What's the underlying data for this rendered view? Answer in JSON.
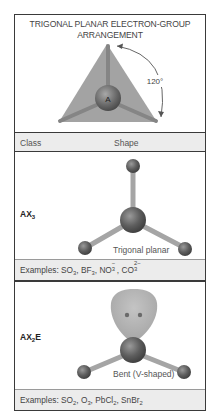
{
  "title": {
    "line1": "TRIGONAL PLANAR ELECTRON-GROUP",
    "line2": "ARRANGEMENT"
  },
  "diagram": {
    "central_atom_label": "A",
    "angle_label": "120°",
    "colors": {
      "triangle_fill": "#a0a0a0",
      "bond": "#8c8c8c",
      "atom": "#5a5a5a",
      "lone_pair_lobe": "#b0b0b0",
      "border": "#3a3a3a",
      "row_bg": "#ececec"
    }
  },
  "table": {
    "headers": {
      "class": "Class",
      "shape": "Shape"
    },
    "rows": [
      {
        "class_base": "AX",
        "class_sub": "3",
        "class_suffix": "",
        "shape": "Trigonal planar",
        "examples_prefix": "Examples: ",
        "examples": [
          {
            "base": "SO",
            "sub": "3",
            "sup": ""
          },
          {
            "base": "BF",
            "sub": "3",
            "sup": ""
          },
          {
            "base": "NO",
            "sub": "3",
            "sup": "−"
          },
          {
            "base": "CO",
            "sub": "3",
            "sup": "2−"
          }
        ]
      },
      {
        "class_base": "AX",
        "class_sub": "2",
        "class_suffix": "E",
        "shape": "Bent (V-shaped)",
        "examples_prefix": "Examples: ",
        "examples": [
          {
            "base": "SO",
            "sub": "2",
            "sup": ""
          },
          {
            "base": "O",
            "sub": "3",
            "sup": ""
          },
          {
            "base": "PbCl",
            "sub": "2",
            "sup": ""
          },
          {
            "base": "SnBr",
            "sub": "2",
            "sup": ""
          }
        ]
      }
    ]
  }
}
